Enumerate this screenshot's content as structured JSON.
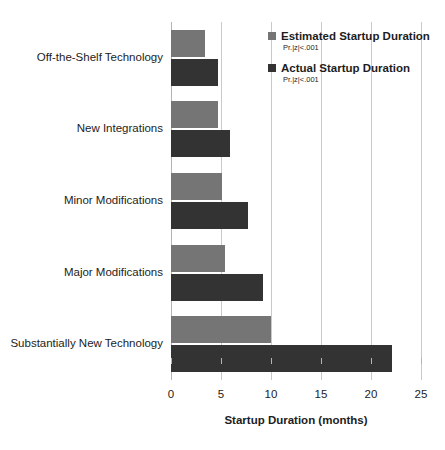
{
  "chart_data": {
    "type": "bar",
    "orientation": "horizontal",
    "title": "",
    "xlabel": "Startup Duration (months)",
    "ylabel": "",
    "xlim": [
      0,
      25
    ],
    "xticks": [
      0,
      5,
      10,
      15,
      20,
      25
    ],
    "xtick_labels": [
      "0",
      "5",
      "10",
      "15",
      "20",
      "25"
    ],
    "grid": true,
    "legend_position": "top-right",
    "categories": [
      "Off-the-Shelf Technology",
      "New Integrations",
      "Minor Modifications",
      "Major Modifications",
      "Substantially New Technology"
    ],
    "series": [
      {
        "name": "Estimated Startup Duration",
        "note": "Pr.|z|<.001",
        "color": "#757575",
        "values": [
          3.4,
          4.7,
          5.1,
          5.4,
          10.0
        ]
      },
      {
        "name": "Actual Startup Duration",
        "note": "Pr.|z|<.001",
        "color": "#333333",
        "values": [
          4.7,
          5.9,
          7.7,
          9.2,
          22.1
        ]
      }
    ]
  },
  "legend": {
    "entries": [
      {
        "label": "Estimated Startup Duration",
        "sub": "Pr.|z|<.001"
      },
      {
        "label": "Actual Startup Duration",
        "sub": "Pr.|z|<.001"
      }
    ]
  },
  "axis": {
    "x_title": "Startup Duration (months)",
    "x_tick_labels": [
      "0",
      "5",
      "10",
      "15",
      "20",
      "25"
    ]
  },
  "colors": {
    "estimated": "#757575",
    "actual": "#333333",
    "gridline": "#c9c9c9",
    "text": "#1d1d1d",
    "background": "#ffffff"
  }
}
